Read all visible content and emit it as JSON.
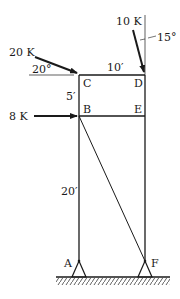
{
  "diagram": {
    "type": "frame-structure",
    "nodes": {
      "A": {
        "label": "A"
      },
      "B": {
        "label": "B"
      },
      "C": {
        "label": "C"
      },
      "D": {
        "label": "D"
      },
      "E": {
        "label": "E"
      },
      "F": {
        "label": "F"
      }
    },
    "dimensions": {
      "cd": "10′",
      "bc": "5′",
      "ab": "20′"
    },
    "loads": {
      "load_c": {
        "magnitude": "20 K",
        "angle": "20°"
      },
      "load_d": {
        "magnitude": "10 K",
        "angle": "15°"
      },
      "load_b": {
        "magnitude": "8 K"
      }
    },
    "colors": {
      "line": "#1a1a1a",
      "background": "#ffffff"
    }
  }
}
